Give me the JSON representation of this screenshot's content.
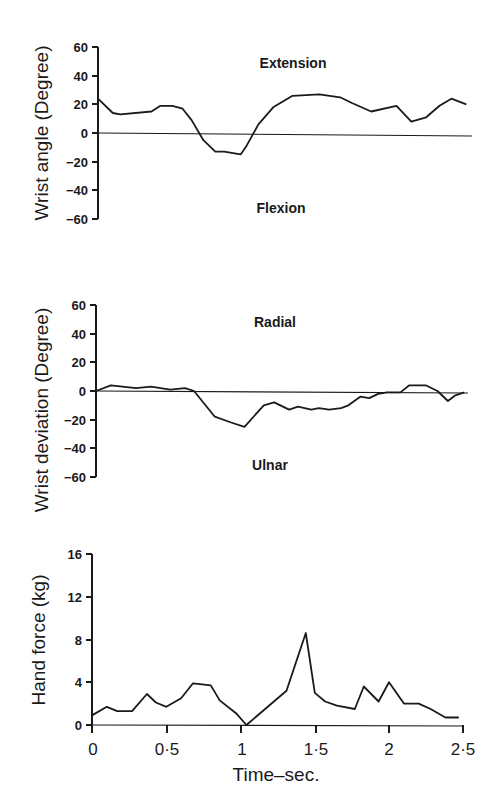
{
  "chart_data": [
    {
      "type": "line",
      "title": "",
      "ylabel": "Wrist angle (Degree)",
      "xlabel": "",
      "ylim": [
        -60,
        60
      ],
      "yticks": [
        60,
        40,
        20,
        0,
        -20,
        -40,
        -60
      ],
      "annotations": [
        "Extension",
        "Flexion"
      ],
      "grid": false,
      "series": [
        {
          "name": "Wrist angle",
          "x": [
            0,
            0.1,
            0.15,
            0.36,
            0.42,
            0.5,
            0.57,
            0.63,
            0.71,
            0.79,
            0.85,
            0.96,
            1.0,
            1.08,
            1.18,
            1.31,
            1.49,
            1.63,
            1.71,
            1.84,
            2.01,
            2.11,
            2.21,
            2.3,
            2.38,
            2.48
          ],
          "values": [
            24,
            14,
            13,
            15,
            19,
            19,
            17,
            9,
            -5,
            -13,
            -13,
            -15,
            -9,
            6,
            18,
            26,
            27,
            25,
            21,
            15,
            19,
            8,
            11,
            19,
            24,
            20
          ]
        }
      ]
    },
    {
      "type": "line",
      "title": "",
      "ylabel": "Wrist deviation (Degree)",
      "xlabel": "",
      "ylim": [
        -60,
        60
      ],
      "yticks": [
        60,
        40,
        20,
        0,
        -20,
        -40,
        -60
      ],
      "annotations": [
        "Radial",
        "Ulnar"
      ],
      "grid": false,
      "series": [
        {
          "name": "Wrist deviation",
          "x": [
            0,
            0.1,
            0.27,
            0.37,
            0.5,
            0.6,
            0.66,
            0.8,
            0.91,
            1.0,
            1.13,
            1.2,
            1.3,
            1.36,
            1.45,
            1.5,
            1.57,
            1.65,
            1.7,
            1.78,
            1.84,
            1.9,
            1.96,
            2.05,
            2.11,
            2.22,
            2.3,
            2.37,
            2.42,
            2.48
          ],
          "values": [
            0,
            4,
            2,
            3,
            1,
            2,
            0,
            -18,
            -22,
            -25,
            -10,
            -8,
            -13,
            -11,
            -13,
            -12,
            -13,
            -12,
            -10,
            -4,
            -5,
            -2,
            -1,
            -1,
            4,
            4,
            0,
            -7,
            -3,
            -1
          ]
        }
      ]
    },
    {
      "type": "line",
      "title": "",
      "ylabel": "Hand force (kg)",
      "xlabel": "Time–sec.",
      "ylim": [
        0,
        16
      ],
      "xlim": [
        0,
        2.5
      ],
      "yticks": [
        16,
        12,
        8,
        4,
        0
      ],
      "xticks": [
        "0",
        "0·5",
        "1",
        "1·5",
        "2",
        "2·5"
      ],
      "grid": false,
      "series": [
        {
          "name": "Hand force",
          "x": [
            0,
            0.1,
            0.17,
            0.27,
            0.37,
            0.43,
            0.5,
            0.6,
            0.68,
            0.8,
            0.86,
            0.97,
            1.04,
            1.31,
            1.44,
            1.5,
            1.57,
            1.65,
            1.77,
            1.83,
            1.93,
            2.0,
            2.1,
            2.2,
            2.28,
            2.38,
            2.47
          ],
          "values": [
            0.9,
            1.7,
            1.3,
            1.3,
            2.9,
            2.1,
            1.7,
            2.5,
            3.9,
            3.7,
            2.3,
            1.1,
            0,
            3.2,
            8.6,
            3.0,
            2.2,
            1.8,
            1.5,
            3.6,
            2.2,
            4.0,
            2.0,
            2.0,
            1.5,
            0.7,
            0.7
          ]
        }
      ]
    }
  ],
  "panels": {
    "top": {
      "ylabel": "Wrist angle (Degree)",
      "ticks": [
        "60",
        "40",
        "20",
        "0",
        "−20",
        "−40",
        "−60"
      ],
      "anno_top": "Extension",
      "anno_bottom": "Flexion"
    },
    "middle": {
      "ylabel": "Wrist deviation (Degree)",
      "ticks": [
        "60",
        "40",
        "20",
        "0",
        "−20",
        "−40",
        "−60"
      ],
      "anno_top": "Radial",
      "anno_bottom": "Ulnar"
    },
    "bottom": {
      "ylabel": "Hand force (kg)",
      "ticks": [
        "16",
        "12",
        "8",
        "4",
        "0"
      ],
      "xticks": [
        "0",
        "0·5",
        "1",
        "1·5",
        "2",
        "2·5"
      ],
      "xlabel": "Time–sec."
    }
  }
}
